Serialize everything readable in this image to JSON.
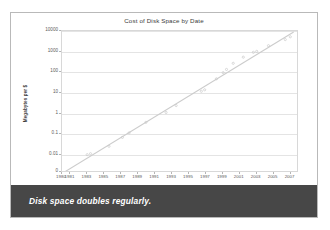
{
  "card": {
    "background_color": "#ffffff",
    "border_color": "#b9b9b9"
  },
  "caption": {
    "text": "Disk space doubles regularly.",
    "background_color": "#474747",
    "text_color": "#ffffff"
  },
  "chart_data": {
    "type": "scatter",
    "title": "Cost of Disk Space by Date",
    "xlabel": "",
    "ylabel": "Megabytes per $",
    "xlim": [
      1980,
      2008
    ],
    "ylim_log": [
      0.001,
      10000
    ],
    "grid": true,
    "legend": "none",
    "y_scale": "log",
    "y_ticks": [
      "10000",
      "1000",
      "100",
      "10",
      "1",
      "0.1",
      "0.01",
      "0"
    ],
    "y_tick_values": [
      10000,
      1000,
      100,
      10,
      1,
      0.1,
      0.01,
      0
    ],
    "x_ticks": [
      "1980",
      "1981",
      "1983",
      "1985",
      "1987",
      "1989",
      "1991",
      "1993",
      "1995",
      "1997",
      "1999",
      "2001",
      "2003",
      "2005",
      "2007"
    ],
    "x_tick_values": [
      1980,
      1981,
      1983,
      1985,
      1987,
      1989,
      1991,
      1993,
      1995,
      1997,
      1999,
      2001,
      2003,
      2005,
      2007
    ],
    "series": [
      {
        "name": "Megabytes per dollar",
        "marker": "dot",
        "color": "#c9c9c9",
        "points": [
          {
            "x": 1983.0,
            "y": 0.0085
          },
          {
            "x": 1983.4,
            "y": 0.0095
          },
          {
            "x": 1985.6,
            "y": 0.022
          },
          {
            "x": 1987.2,
            "y": 0.06
          },
          {
            "x": 1988.0,
            "y": 0.1
          },
          {
            "x": 1990.0,
            "y": 0.33
          },
          {
            "x": 1992.4,
            "y": 1.0
          },
          {
            "x": 1993.6,
            "y": 2.2
          },
          {
            "x": 1996.6,
            "y": 11.0
          },
          {
            "x": 1997.0,
            "y": 13.0
          },
          {
            "x": 1998.4,
            "y": 45.0
          },
          {
            "x": 1999.2,
            "y": 90.0
          },
          {
            "x": 1999.6,
            "y": 130.0
          },
          {
            "x": 2000.4,
            "y": 260.0
          },
          {
            "x": 2001.6,
            "y": 520.0
          },
          {
            "x": 2002.8,
            "y": 900.0
          },
          {
            "x": 2003.2,
            "y": 1000.0
          },
          {
            "x": 2004.6,
            "y": 1900.0
          },
          {
            "x": 2006.6,
            "y": 3800.0
          },
          {
            "x": 2007.2,
            "y": 5200.0
          }
        ]
      }
    ],
    "trendline": {
      "name": "Exponential fit",
      "color": "#cccccc",
      "start": {
        "x": 1980.3,
        "y": 0.0012
      },
      "end": {
        "x": 2007.6,
        "y": 9000.0
      },
      "note": "log-linear fit, doubling roughly every 14 months"
    }
  }
}
